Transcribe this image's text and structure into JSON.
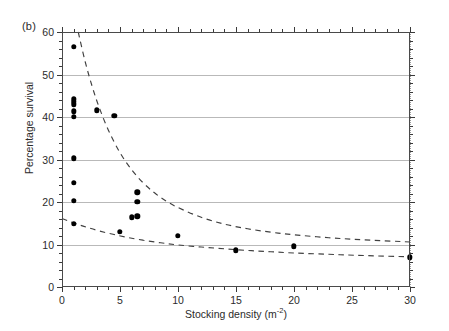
{
  "panel": {
    "label": "(b)"
  },
  "chart_data": {
    "type": "scatter",
    "title": "",
    "xlabel": "Stocking density (m",
    "xlabel_sup": "-2",
    "xlabel_close": ")",
    "ylabel": "Percentage survival",
    "xlim": [
      0,
      30
    ],
    "ylim": [
      0,
      60
    ],
    "xticks": [
      0,
      5,
      10,
      15,
      20,
      25,
      30
    ],
    "yticks": [
      0,
      10,
      20,
      30,
      40,
      50,
      60
    ],
    "xtick_labels": [
      "0",
      "5",
      "10",
      "15",
      "20",
      "25",
      "30"
    ],
    "ytick_labels": [
      "0",
      "10",
      "20",
      "30",
      "40",
      "50",
      "60"
    ],
    "x_minor_step": 1,
    "y_minor_step": 2,
    "grid": "horizontal",
    "grid_color": "#b9b9b9",
    "legend": "none",
    "marker": "filled-circle",
    "marker_color": "#000000",
    "reference_lines": [
      {
        "orientation": "vertical",
        "x": 0,
        "style": "dotted"
      },
      {
        "orientation": "vertical",
        "x": 30,
        "style": "dotted"
      }
    ],
    "points": [
      {
        "x": 1.0,
        "y": 56.5
      },
      {
        "x": 1.0,
        "y": 44.2
      },
      {
        "x": 1.0,
        "y": 43.6
      },
      {
        "x": 1.0,
        "y": 43.0
      },
      {
        "x": 1.0,
        "y": 41.3
      },
      {
        "x": 1.0,
        "y": 40.0
      },
      {
        "x": 1.0,
        "y": 30.3
      },
      {
        "x": 1.0,
        "y": 24.5
      },
      {
        "x": 1.0,
        "y": 20.3
      },
      {
        "x": 1.0,
        "y": 14.8
      },
      {
        "x": 3.0,
        "y": 41.6
      },
      {
        "x": 4.5,
        "y": 40.3
      },
      {
        "x": 6.0,
        "y": 16.4
      },
      {
        "x": 5.0,
        "y": 13.0
      },
      {
        "x": 6.5,
        "y": 22.3
      },
      {
        "x": 6.5,
        "y": 20.1
      },
      {
        "x": 6.5,
        "y": 16.6
      },
      {
        "x": 10.0,
        "y": 12.0
      },
      {
        "x": 15.0,
        "y": 8.6
      },
      {
        "x": 20.0,
        "y": 9.6
      },
      {
        "x": 30.0,
        "y": 7.0
      }
    ],
    "curves": [
      {
        "name": "upper-bound",
        "style": "dashed",
        "description": "upper fitted decay curve, asymptote near 10",
        "points": [
          {
            "x": 1.4,
            "y": 60.0
          },
          {
            "x": 2.0,
            "y": 53.0
          },
          {
            "x": 2.6,
            "y": 47.2
          },
          {
            "x": 3.2,
            "y": 42.3
          },
          {
            "x": 4.0,
            "y": 36.9
          },
          {
            "x": 5.0,
            "y": 31.6
          },
          {
            "x": 6.0,
            "y": 27.6
          },
          {
            "x": 7.0,
            "y": 24.5
          },
          {
            "x": 8.0,
            "y": 22.1
          },
          {
            "x": 9.0,
            "y": 20.2
          },
          {
            "x": 10.0,
            "y": 18.7
          },
          {
            "x": 12.0,
            "y": 16.4
          },
          {
            "x": 14.0,
            "y": 14.8
          },
          {
            "x": 16.0,
            "y": 13.7
          },
          {
            "x": 18.0,
            "y": 12.9
          },
          {
            "x": 20.0,
            "y": 12.3
          },
          {
            "x": 23.0,
            "y": 11.6
          },
          {
            "x": 26.0,
            "y": 11.1
          },
          {
            "x": 30.0,
            "y": 10.6
          }
        ]
      },
      {
        "name": "lower-bound",
        "style": "dashed",
        "description": "lower fitted decay curve, asymptote near 7",
        "points": [
          {
            "x": 0.0,
            "y": 16.1
          },
          {
            "x": 0.6,
            "y": 15.5
          },
          {
            "x": 1.4,
            "y": 14.7
          },
          {
            "x": 2.2,
            "y": 14.0
          },
          {
            "x": 3.2,
            "y": 13.2
          },
          {
            "x": 4.4,
            "y": 12.4
          },
          {
            "x": 5.6,
            "y": 11.7
          },
          {
            "x": 7.0,
            "y": 11.0
          },
          {
            "x": 8.5,
            "y": 10.4
          },
          {
            "x": 10.0,
            "y": 9.9
          },
          {
            "x": 12.0,
            "y": 9.4
          },
          {
            "x": 14.0,
            "y": 9.0
          },
          {
            "x": 16.0,
            "y": 8.6
          },
          {
            "x": 18.0,
            "y": 8.3
          },
          {
            "x": 20.0,
            "y": 8.0
          },
          {
            "x": 23.0,
            "y": 7.7
          },
          {
            "x": 26.0,
            "y": 7.4
          },
          {
            "x": 30.0,
            "y": 7.1
          }
        ]
      }
    ]
  }
}
